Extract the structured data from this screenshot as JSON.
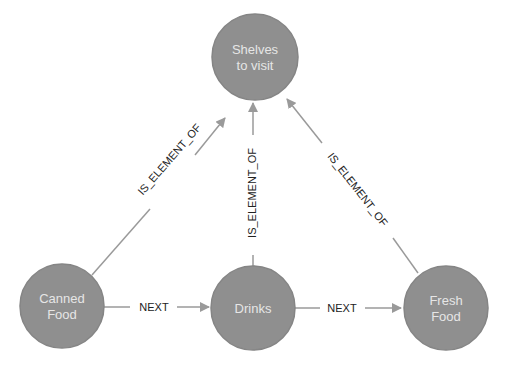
{
  "graph": {
    "node_color": "#8f8f8f",
    "edge_color": "#9a9a9a",
    "nodes": [
      {
        "id": "shelves",
        "lines": [
          "Shelves",
          "to visit"
        ]
      },
      {
        "id": "canned",
        "lines": [
          "Canned",
          "Food"
        ]
      },
      {
        "id": "drinks",
        "lines": [
          "Drinks"
        ]
      },
      {
        "id": "fresh",
        "lines": [
          "Fresh",
          "Food"
        ]
      }
    ],
    "edges": [
      {
        "from": "canned",
        "to": "shelves",
        "label": "IS_ELEMENT_OF"
      },
      {
        "from": "drinks",
        "to": "shelves",
        "label": "IS_ELEMENT_OF"
      },
      {
        "from": "fresh",
        "to": "shelves",
        "label": "IS_ELEMENT_OF"
      },
      {
        "from": "canned",
        "to": "drinks",
        "label": "NEXT"
      },
      {
        "from": "drinks",
        "to": "fresh",
        "label": "NEXT"
      }
    ]
  }
}
